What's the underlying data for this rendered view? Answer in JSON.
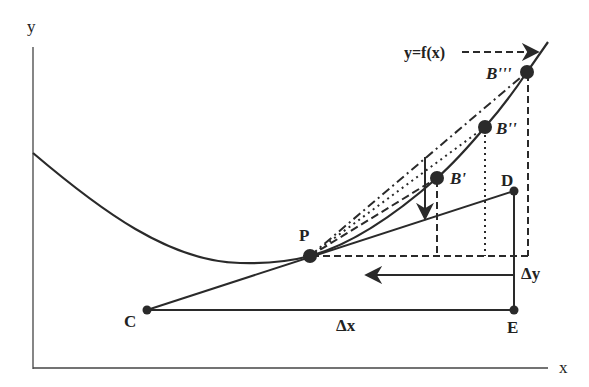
{
  "colors": {
    "ink": "#2a2a2a",
    "background": "#ffffff"
  },
  "axes": {
    "x_label": "x",
    "y_label": "y"
  },
  "curve": {
    "label": "y=f(x)",
    "description": "convex curve decreasing from y-axis, minimum near P, rising steeply to upper right"
  },
  "points": {
    "P": {
      "label": "P"
    },
    "B1": {
      "label": "B'"
    },
    "B2": {
      "label": "B''"
    },
    "B3": {
      "label": "B'''"
    },
    "C": {
      "label": "C"
    },
    "D": {
      "label": "D"
    },
    "E": {
      "label": "E"
    }
  },
  "increments": {
    "dx": "Δx",
    "dy": "Δy"
  },
  "secants": [
    {
      "from": "P",
      "to": "B'",
      "style": "dashed"
    },
    {
      "from": "P",
      "to": "B''",
      "style": "dotted"
    },
    {
      "from": "P",
      "to": "B'''",
      "style": "dash-dot"
    }
  ],
  "tangent": {
    "from": "C",
    "through": "P",
    "to": "D"
  }
}
